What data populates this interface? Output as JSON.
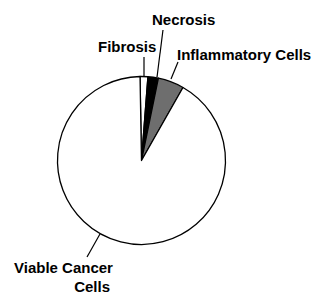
{
  "chart_data": {
    "type": "pie",
    "title": "",
    "start_angle_deg": -1,
    "direction": "clockwise",
    "categories": [
      "Fibrosis",
      "Necrosis",
      "Inflammatory Cells",
      "Viable Cancer Cells"
    ],
    "values": [
      1.5,
      2,
      5,
      91.5
    ],
    "unit": "%",
    "colors": [
      "#ffffff",
      "#000000",
      "#6e6e6e",
      "#ffffff"
    ],
    "legend": "none (direct labels with leader lines)"
  },
  "labels": {
    "fibrosis": "Fibrosis",
    "necrosis": "Necrosis",
    "inflammatory": "Inflammatory Cells",
    "viable_line1": "Viable Cancer",
    "viable_line2": "Cells"
  }
}
